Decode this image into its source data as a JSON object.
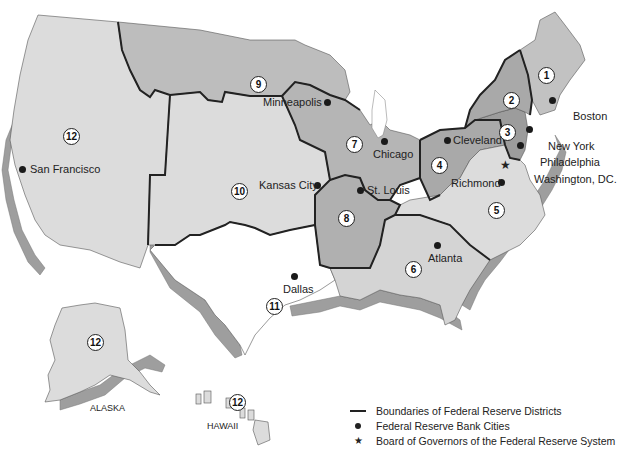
{
  "map": {
    "title": "Federal Reserve Districts",
    "colors": {
      "light": "#dcdcdc",
      "medium": "#bdbdbd",
      "dark": "#a9a9a9",
      "white": "#ffffff",
      "boundary": "#222222",
      "extrusion": "#9e9e9e"
    },
    "districts": [
      {
        "number": "1",
        "city": "Boston"
      },
      {
        "number": "2",
        "city": "New York"
      },
      {
        "number": "3",
        "city": "Philadelphia"
      },
      {
        "number": "4",
        "city": "Cleveland"
      },
      {
        "number": "5",
        "city": "Richmond"
      },
      {
        "number": "6",
        "city": "Atlanta"
      },
      {
        "number": "7",
        "city": "Chicago"
      },
      {
        "number": "8",
        "city": "St. Louis"
      },
      {
        "number": "9",
        "city": "Minneapolis"
      },
      {
        "number": "10",
        "city": "Kansas City"
      },
      {
        "number": "11",
        "city": "Dallas"
      },
      {
        "number": "12",
        "city": "San Francisco"
      }
    ],
    "capital": "Washington, DC.",
    "insets": {
      "alaska": {
        "label": "ALASKA",
        "district": "12"
      },
      "hawaii": {
        "label": "HAWAII",
        "district": "12"
      }
    }
  },
  "legend": {
    "items": [
      {
        "symbol": "line",
        "label": "Boundaries of Federal Reserve Districts"
      },
      {
        "symbol": "dot",
        "label": "Federal Reserve Bank Cities"
      },
      {
        "symbol": "star",
        "label": "Board of Governors of the Federal Reserve System"
      }
    ]
  }
}
